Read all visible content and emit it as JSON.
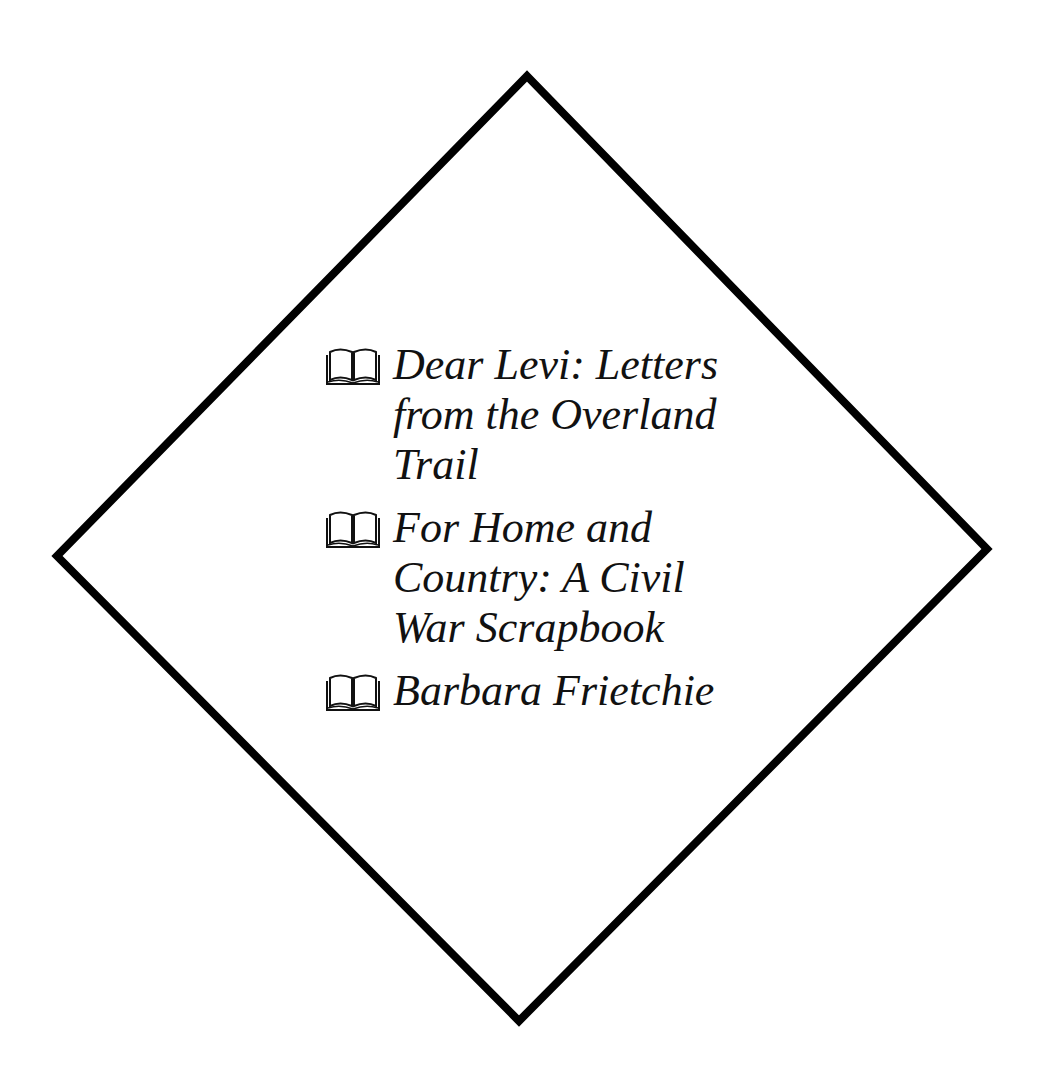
{
  "shape": {
    "type": "diamond",
    "stroke": "#000000",
    "stroke_width": 8,
    "points": {
      "top": [
        527,
        72
      ],
      "right": [
        991,
        549
      ],
      "bottom": [
        519,
        1025
      ],
      "left": [
        52,
        556
      ]
    }
  },
  "books": [
    {
      "icon": "open-book-icon",
      "title": "Dear Levi: Letters from the Overland Trail"
    },
    {
      "icon": "open-book-icon",
      "title": "For Home and Country: A Civil War Scrapbook"
    },
    {
      "icon": "open-book-icon",
      "title": "Barbara Frietchie"
    }
  ]
}
